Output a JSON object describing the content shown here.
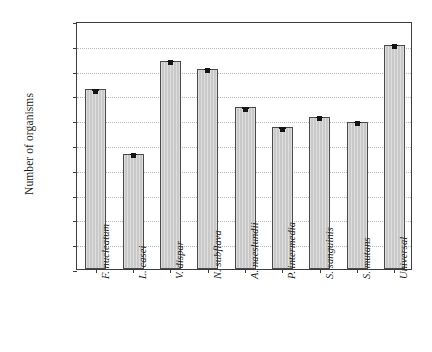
{
  "chart_data": {
    "type": "bar",
    "title": "",
    "xlabel": "",
    "ylabel": "Number of organisms",
    "yscale": "log",
    "ylim": [
      1,
      10000000000
    ],
    "grid": true,
    "legend": "none",
    "ytick_labels": [
      "1E+10",
      "1E+09",
      "1E+08",
      "1E+07",
      "1E+06",
      "1E+05",
      "1E+04",
      "1E+03",
      "1E+02",
      "1E+01",
      "1E+00"
    ],
    "ytick_values": [
      10000000000,
      1000000000,
      100000000,
      10000000,
      1000000,
      100000,
      10000,
      1000,
      100,
      10,
      1
    ],
    "categories": [
      "F. nucleatum",
      "L. casei",
      "V. dispar",
      "N. subflava",
      "A. naeslundii",
      "P. intermedia",
      "S. sanguinis",
      "S. mutans",
      "Universal"
    ],
    "values": [
      18000000,
      44000,
      250000000,
      120000000,
      3400000,
      530000,
      1400000,
      850000,
      1100000000
    ],
    "errors": [
      3500000,
      8000,
      45000000,
      22000000,
      600000,
      95000,
      250000,
      160000,
      190000000
    ],
    "bar_color": "#c9c9c9",
    "bar_edge_color": "#4a4a4a",
    "error_color": "#141414",
    "axis_color": "#3d3d3d",
    "grid_color": "#b9b9b9"
  }
}
